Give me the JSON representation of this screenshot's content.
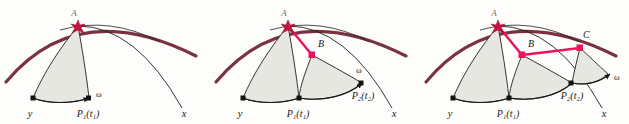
{
  "figure": {
    "panel_count": 3,
    "background_color": "#fdfdfc",
    "colors": {
      "outer_arc": "#7a3240",
      "segment_line": "#e8145e",
      "curve": "#1a1a1a",
      "sector_fill": "#e7e7e2",
      "sector_stroke": "#2a2a2a",
      "text": "#1a1a1a"
    }
  },
  "panels": [
    {
      "id": "panel-1",
      "name": "stage-one",
      "labels": {
        "y_axis": "y",
        "x_axis": "x",
        "omega": "ω",
        "point_p1": "P₁(t₁)",
        "apex": "A"
      },
      "points": [
        "A",
        "P₁(t₁)"
      ],
      "segments": []
    },
    {
      "id": "panel-2",
      "name": "stage-two",
      "labels": {
        "y_axis": "y",
        "x_axis": "x",
        "omega": "ω",
        "point_p1": "P₁(t₁)",
        "point_p2": "P₂(t₂)",
        "apex": "A",
        "point_b": "B"
      },
      "points": [
        "A",
        "B",
        "P₁(t₁)",
        "P₂(t₂)"
      ],
      "segments": [
        "A-B"
      ]
    },
    {
      "id": "panel-3",
      "name": "stage-three",
      "labels": {
        "y_axis": "y",
        "x_axis": "x",
        "omega": "ω",
        "point_p1": "P₁(t₁)",
        "point_p2": "P₂(t₂)",
        "apex": "A",
        "point_b": "B",
        "point_c": "C"
      },
      "points": [
        "A",
        "B",
        "C",
        "P₁(t₁)",
        "P₂(t₂)"
      ],
      "segments": [
        "A-B",
        "B-C"
      ]
    }
  ]
}
